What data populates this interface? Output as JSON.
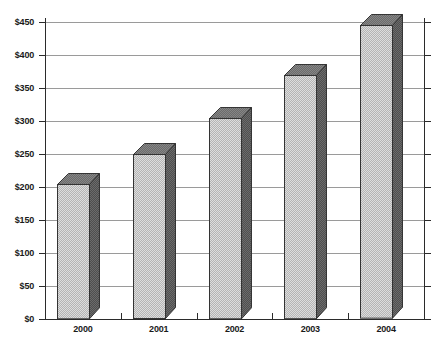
{
  "chart_data": {
    "type": "bar",
    "title": "",
    "subtitle": "",
    "xlabel": "",
    "ylabel": "",
    "categories": [
      "2000",
      "2001",
      "2002",
      "2003",
      "2004"
    ],
    "values": [
      205,
      250,
      305,
      370,
      445
    ],
    "ylim": [
      0,
      450
    ],
    "ytick_values": [
      0,
      50,
      100,
      150,
      200,
      250,
      300,
      350,
      400,
      450
    ],
    "ytick_labels": [
      "$0",
      "$50",
      "$100",
      "$150",
      "$200",
      "$250",
      "$300",
      "$350",
      "$400",
      "$450"
    ],
    "grid": true,
    "grid_axis": "y",
    "legend": null,
    "legend_position": "none",
    "style": "3d-column",
    "series": [
      {
        "name": "",
        "values": [
          205,
          250,
          305,
          370,
          445
        ]
      }
    ],
    "colors": {
      "bar_front": "#b4b4b4",
      "bar_side": "#4f4f4f",
      "bar_top": "#6b6b6b",
      "bar_outline": "#333333",
      "gridline": "#9a9a9a",
      "axis": "#2b2b2b",
      "text": "#1a1a1a",
      "background": "#ffffff"
    }
  }
}
